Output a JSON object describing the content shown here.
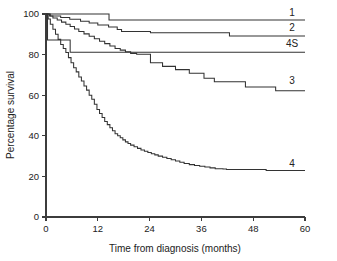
{
  "chart_data": {
    "type": "line",
    "title": "",
    "subtitle": "",
    "xlabel": "Time from diagnosis (months)",
    "ylabel": "Percentage survival",
    "xlim": [
      0,
      60
    ],
    "ylim": [
      0,
      100
    ],
    "xticks": [
      0,
      12,
      24,
      36,
      48,
      60
    ],
    "yticks": [
      0,
      20,
      40,
      60,
      80,
      100
    ],
    "xtick_labels": [
      "0",
      "12",
      "24",
      "36",
      "48",
      "60"
    ],
    "ytick_labels": [
      "0",
      "20",
      "40",
      "60",
      "80",
      "100"
    ],
    "grid": false,
    "legend_position": "right-inline-end-of-curve",
    "step_style": "post",
    "series": [
      {
        "name": "1",
        "label": "1",
        "label_x": 57.0,
        "label_y": 100.5,
        "final_value": 97,
        "x": [
          0,
          2,
          5,
          14,
          14.6,
          60
        ],
        "y": [
          100,
          100,
          100,
          100,
          97,
          97
        ]
      },
      {
        "name": "2",
        "label": "2",
        "label_x": 57.0,
        "label_y": 93.5,
        "final_value": 89,
        "x": [
          0,
          1,
          3.4,
          5.5,
          8,
          10,
          12,
          14.5,
          16.5,
          17.5,
          23.8,
          24.2,
          41.5,
          42.5,
          60
        ],
        "y": [
          100,
          99,
          98.3,
          97.4,
          96.4,
          95.6,
          94.6,
          93.6,
          92.4,
          91.4,
          91.4,
          90.8,
          90.8,
          89.2,
          89.2
        ]
      },
      {
        "name": "4S",
        "label": "4S",
        "label_x": 57.0,
        "label_y": 85.5,
        "final_value": 81,
        "x": [
          0,
          0.35,
          0.35,
          5.6,
          5.6,
          60
        ],
        "y": [
          100,
          100,
          87.2,
          87.2,
          81.2,
          81.2
        ]
      },
      {
        "name": "3",
        "label": "3",
        "label_x": 57.0,
        "label_y": 67.0,
        "final_value": 62,
        "x": [
          0,
          0.8,
          1.6,
          2.6,
          3.6,
          4.6,
          5.6,
          6.6,
          7.6,
          8.8,
          10.0,
          11.2,
          12.4,
          13.6,
          14.8,
          16.0,
          17.2,
          18.4,
          19.6,
          21.0,
          22.4,
          23.8,
          24.2,
          26.5,
          27.0,
          29.5,
          30.0,
          32.5,
          33.2,
          36.0,
          36.6,
          38.4,
          39.0,
          45.5,
          46.2,
          52.5,
          53.2,
          60
        ],
        "y": [
          100,
          99,
          98,
          97,
          96,
          95,
          93.8,
          92.6,
          91.4,
          90.2,
          89.0,
          87.8,
          86.6,
          85.4,
          84.2,
          83.0,
          82.2,
          81.4,
          80.6,
          80.2,
          80.2,
          80.2,
          76.0,
          76.0,
          74.2,
          74.2,
          72.6,
          72.6,
          70.8,
          70.8,
          68.4,
          68.4,
          66.6,
          66.6,
          64.0,
          64.0,
          62.2,
          62.2
        ]
      },
      {
        "name": "4",
        "label": "4",
        "label_x": 57.0,
        "label_y": 26.5,
        "final_value": 23,
        "x": [
          0,
          0.5,
          1.0,
          1.6,
          2.2,
          2.8,
          3.4,
          4.0,
          4.6,
          5.2,
          5.8,
          6.4,
          7.0,
          7.6,
          8.2,
          8.8,
          9.4,
          10.0,
          10.6,
          11.2,
          11.8,
          12.4,
          13.0,
          13.6,
          14.2,
          14.8,
          15.4,
          16.0,
          16.6,
          17.2,
          17.8,
          18.4,
          19.0,
          19.6,
          20.4,
          21.2,
          22.0,
          22.8,
          23.6,
          24.4,
          25.2,
          26.0,
          27.0,
          28.0,
          29.0,
          30.0,
          31.0,
          32.0,
          33.2,
          34.4,
          35.6,
          36.8,
          38.0,
          39.2,
          41.0,
          41.8,
          50.0,
          51.0,
          60
        ],
        "y": [
          100,
          97.5,
          95.0,
          92.5,
          90.0,
          87.5,
          85.0,
          83.0,
          81.0,
          78.5,
          76.0,
          73.5,
          71.5,
          69.0,
          67.0,
          64.5,
          62.5,
          60.0,
          58.0,
          55.5,
          53.0,
          51.0,
          49.0,
          47.0,
          45.5,
          44.0,
          42.5,
          41.0,
          40.0,
          39.0,
          38.0,
          37.0,
          36.2,
          35.4,
          34.6,
          33.8,
          33.0,
          32.4,
          31.8,
          31.2,
          30.6,
          30.0,
          29.4,
          28.8,
          28.2,
          27.6,
          27.0,
          26.4,
          25.8,
          25.4,
          25.0,
          24.6,
          24.2,
          23.8,
          23.6,
          23.4,
          23.4,
          22.9,
          22.9
        ]
      }
    ]
  },
  "axes": {
    "y_title": "Percentage survival",
    "x_title": "Time from diagnosis (months)"
  },
  "colors": {
    "axis": "#3c3c3c",
    "curve": "#333333",
    "text": "#222222",
    "background": "#ffffff"
  }
}
